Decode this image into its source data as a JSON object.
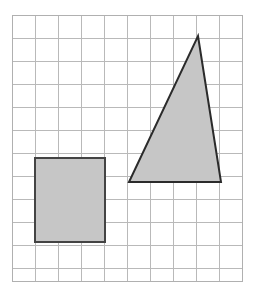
{
  "figure": {
    "title": "Shaded rectangle and triangle on a square grid",
    "background_color": "#ffffff",
    "width": 254,
    "height": 293
  },
  "grid": {
    "name": "square-grid",
    "origin_x": 12,
    "origin_y": 15,
    "cell_size": 23,
    "columns": 10,
    "rows": 11.5,
    "right": 242,
    "bottom": 281,
    "line_color": "#b9b9b9",
    "line_width": 1,
    "border_color": "#b0b0b0",
    "border_width": 1,
    "unit_label": "1 unit per square",
    "vertical_lines_x": [
      12,
      35,
      58,
      81,
      104,
      127,
      150,
      173,
      196,
      219,
      242
    ],
    "horizontal_lines_y": [
      15,
      38,
      61,
      84,
      107,
      130,
      153,
      176,
      199,
      222,
      245,
      268,
      281
    ]
  },
  "chart_data": {
    "type": "scatter",
    "title": "Shaded rectangle and triangle on a square grid",
    "xlabel": "",
    "ylabel": "",
    "grid": true,
    "legend_position": "none",
    "xlim": [
      0,
      10
    ],
    "ylim": [
      0,
      11.5
    ],
    "shapes": [
      {
        "name": "rectangle",
        "type": "rectangle",
        "fill": "#c6c6c6",
        "stroke": "#444444",
        "stroke_width": 2,
        "grid_cells_wide": 3,
        "grid_cells_tall": 3.7,
        "pixel_x": 35,
        "pixel_y": 158,
        "pixel_width": 70,
        "pixel_height": 84,
        "grid_points": [
          [
            1,
            5.2
          ],
          [
            4,
            5.2
          ],
          [
            4,
            8.9
          ],
          [
            1,
            8.9
          ]
        ]
      },
      {
        "name": "triangle",
        "type": "polygon",
        "fill": "#c6c6c6",
        "stroke": "#2b2b2b",
        "stroke_width": 2,
        "pixel_points": "198,36 221,182 129,182",
        "grid_points": [
          [
            8.09,
            0.91
          ],
          [
            9.09,
            7.26
          ],
          [
            5.09,
            7.26
          ]
        ],
        "base_cells": 4,
        "height_cells": 6.35
      }
    ]
  },
  "shapes_list": [
    {
      "label": "Rectangle",
      "fill_label": "shaded gray"
    },
    {
      "label": "Triangle",
      "fill_label": "shaded gray"
    }
  ]
}
